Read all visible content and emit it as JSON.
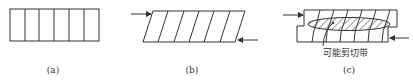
{
  "figure": {
    "panels": [
      {
        "id": "a",
        "label": "(a)",
        "description": "rectangle divided into six vertical cells"
      },
      {
        "id": "b",
        "label": "(b)",
        "description": "sheared parallelogram with six slanted cells; opposing arrows at top-left and bottom-right"
      },
      {
        "id": "c",
        "label": "(c)",
        "description": "two offset stepped blocks with hatched elliptical shear zone; opposing arrows",
        "annotation": "可能剪切带"
      }
    ],
    "colors": {
      "line": "#333333",
      "background": "#ffffff"
    }
  }
}
